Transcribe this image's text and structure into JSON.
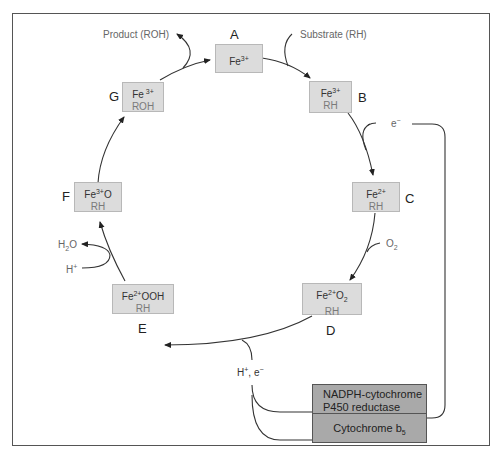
{
  "diagram": {
    "states": [
      {
        "id": "A",
        "top": "Fe",
        "top_sup": "3+",
        "bottom": ""
      },
      {
        "id": "B",
        "top": "Fe",
        "top_sup": "3+",
        "bottom": "RH"
      },
      {
        "id": "C",
        "top": "Fe",
        "top_sup": "2+",
        "bottom": "RH"
      },
      {
        "id": "D",
        "top": "Fe",
        "top_sup": "2+",
        "top_suffix": "O",
        "top_sub": "2",
        "bottom": "RH"
      },
      {
        "id": "E",
        "top": "Fe",
        "top_sup": "2+",
        "top_suffix": "OOH",
        "bottom": "RH"
      },
      {
        "id": "F",
        "top": "Fe",
        "top_sup": "3+",
        "top_suffix": "O",
        "bottom": "RH"
      },
      {
        "id": "G",
        "top": "Fe",
        "top_sup": " 3+",
        "bottom": "ROH"
      }
    ],
    "inputs_outputs": {
      "product": "Product (ROH)",
      "substrate": "Substrate (RH)",
      "electron": "e",
      "electron_sup": "−",
      "oxygen": "O",
      "oxygen_sub": "2",
      "water": "H",
      "water_sub": "2",
      "water_suffix": "O",
      "proton": "H",
      "proton_sup": "+",
      "proton_electron": "H",
      "proton_electron_sup1": "+",
      "proton_electron_mid": ", e",
      "proton_electron_sup2": "−"
    },
    "enzymes": {
      "reductase_line1": "NADPH-cytochrome",
      "reductase_line2": "P450 reductase",
      "cytb5": "Cytochrome b",
      "cytb5_sub": "5"
    },
    "colors": {
      "state_box_fill": "#dcdcdc",
      "enzyme_box_fill": "#a9a9a9",
      "line": "#333333"
    }
  }
}
